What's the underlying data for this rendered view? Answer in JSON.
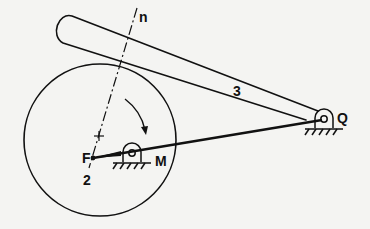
{
  "diagram": {
    "type": "mechanism",
    "colors": {
      "background": "#f4f4f2",
      "ink": "#111111"
    },
    "labels": {
      "normal": "n",
      "follower": "3",
      "pivot_q": "Q",
      "pivot_m": "M",
      "point_f": "F",
      "cam": "2"
    },
    "components": [
      {
        "id": "cam",
        "label": "2",
        "shape": "circle"
      },
      {
        "id": "follower",
        "label": "3",
        "shape": "rounded-bar"
      },
      {
        "id": "ground-pivot-m",
        "label": "M"
      },
      {
        "id": "ground-pivot-q",
        "label": "Q"
      },
      {
        "id": "line-of-centers",
        "from": "F",
        "to": "Q"
      },
      {
        "id": "common-normal",
        "label": "n",
        "style": "dash-dot"
      },
      {
        "id": "rotation-arrow",
        "direction": "clockwise"
      }
    ]
  }
}
